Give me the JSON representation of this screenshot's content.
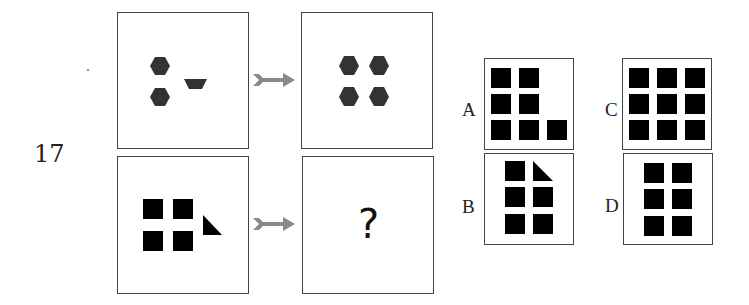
{
  "question": {
    "number": "17",
    "unknown_symbol": "?"
  },
  "panels": {
    "example_from": "three hexagons-like figures: two hexagons and one trapezoid",
    "example_to": "four hexagons",
    "problem_from": "four squares and one right triangle",
    "problem_to": "?"
  },
  "options": [
    {
      "label": "A",
      "description": "6 squares in L shape (2x2 plus bottom row of 3)"
    },
    {
      "label": "B",
      "description": "5 squares and a right triangle in 2x3 grid"
    },
    {
      "label": "C",
      "description": "9 squares in 3x3 grid"
    },
    {
      "label": "D",
      "description": "6 squares in 2x3 grid"
    }
  ],
  "colors": {
    "hexagon": "#333333",
    "square": "#000000",
    "arrow": "#8a8a8a",
    "border": "#444444"
  }
}
